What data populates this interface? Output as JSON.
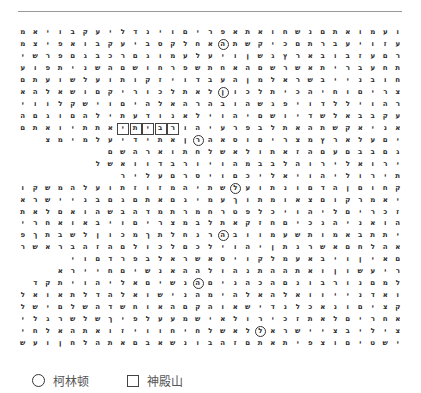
{
  "grid": {
    "direction": "rtl",
    "rows": [
      "ועמואתםנשחואתאפריםוינדליעקבויאמר",
      "עזויעברתםכיקשתהאחלקסביעקבואפיצמבי",
      "רםעזבובארץגשןויעלעמוגםרכבגםפרשים",
      "תחעברית אשרשםהאחתשפרחושםהשניתפועה",
      "חובנייבשראלמןהעבדויזקותועלשועתם",
      "צריםוחיהכיתלכוןלאתלכוריקםושאלהאש",
      "רהויללדויפגשהובהרהאלהיםוישקלוויגד",
      "עקבבאלשדיושםיהוילאנודעתילהםוגםה",
      "אניאקשתהאתלבפרעיהורביתיאתתיואתם",
      "יםעלארץמצריםוסאהרןאתידיעלמימצ",
      "גםבבםעםהזאתולאשלחתוארהשם",
      "ירואלירוהלבבמהויורבדוואשל",
      "תירוליהויאליכםויסרםעליר",
      "קחוםןהדםונתועלשתיהמזוזתועלהמשקו",
      "יאמרקוםצאומתוךעמיגםאתםגםבניישרא",
      "זכריםליהויכלפטרחמרתמדהבשהואםלאת",
      "הואניהנכיםחזקאתלבמצריםויבאואחרית",
      "יתתבאמותשעמוובהרנחלתךמכוןלשבתךפע",
      "אהלחםאשרנתןיהוילכםלכולםהזהבראשר",
      "םאיןויבאעמלקויסאשראלבפרדםוי",
      "ריעשוןואתההתנהולההאנשיםחיירא",
      "למםנורבונםהכהניםהנשיםאליהויתקד",
      "ואדנייוואלהאלהימהנישואלהדלתאואלחם",
      "קציםונאכלנדישאוהקםהאוחשדהשלםישלם",
      "אחריםלאתזכירולאישמעעלפיךשלשרגליםה",
      "ציליבציישראללאשלחיחוויזואתהאלחי",
      "ישטיםוצפיתאתםזהבונשאבםאתהלחןועש"
    ],
    "circled": [
      [
        1,
        14
      ],
      [
        5,
        14
      ],
      [
        9,
        16
      ],
      [
        13,
        13
      ],
      [
        17,
        14
      ],
      [
        21,
        16
      ],
      [
        25,
        11
      ]
    ],
    "boxed": [
      [
        8,
        18
      ],
      [
        8,
        19
      ],
      [
        8,
        20
      ],
      [
        8,
        21
      ],
      [
        8,
        22
      ]
    ]
  },
  "legend": {
    "circle_label": "柯林顿",
    "box_label": "神殿山"
  },
  "colors": {
    "rule": "#9a9a9a",
    "text": "#2a2a2a",
    "legend_text": "#555555"
  }
}
